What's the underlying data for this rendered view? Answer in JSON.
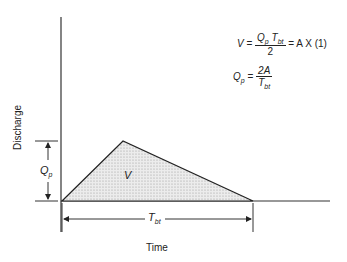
{
  "diagram": {
    "xlabel": "Time",
    "ylabel": "Discharge",
    "area_label": "V",
    "peak_label": {
      "main": "Q",
      "sub": "p"
    },
    "base_label": {
      "main": "T",
      "sub": "bt"
    },
    "equations": {
      "eq1": {
        "lhs": "V",
        "equals": "=",
        "num_main1": "Q",
        "num_sub1": "p",
        "num_main2": "T",
        "num_sub2": "bt",
        "den": "2",
        "rhs": "= A X (1)"
      },
      "eq2": {
        "lhs_main": "Q",
        "lhs_sub": "p",
        "equals": "=",
        "num": "2A",
        "den_main": "T",
        "den_sub": "bt"
      }
    },
    "colors": {
      "line": "#222222",
      "fill": "#d9d9d9"
    }
  }
}
